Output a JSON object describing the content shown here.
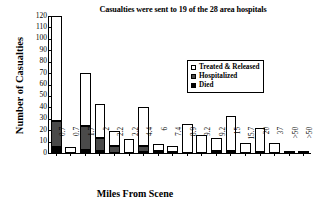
{
  "chart_data": {
    "type": "bar",
    "title": "Casualties were sent to 19 of the 28 area hospitals",
    "xlabel": "Miles From Scene",
    "ylabel": "Number of Casualties",
    "ylim": [
      0,
      120
    ],
    "yticks": [
      0,
      10,
      20,
      30,
      40,
      50,
      60,
      70,
      80,
      90,
      100,
      110,
      120
    ],
    "grid": false,
    "stacked": true,
    "legend_position": "upper-right",
    "categories": [
      "0.7",
      "0.7",
      "1.7",
      "2",
      "2.2",
      "2.2",
      "4.4",
      "6",
      "7.4",
      "8.9",
      "9.2",
      "9.2",
      "15",
      "15.7",
      "20",
      "37",
      ">50",
      ">50"
    ],
    "series": [
      {
        "name": "Treated & Released",
        "color": "#ffffff",
        "values": [
          92,
          5,
          46,
          30,
          13,
          12,
          34,
          6,
          5,
          25,
          16,
          11,
          30,
          9,
          21,
          9,
          1,
          1
        ]
      },
      {
        "name": "Hospitalized",
        "color": "#4a4a4a",
        "values": [
          23,
          0,
          21,
          11,
          6,
          0,
          5,
          2,
          1,
          0,
          0,
          2,
          2,
          0,
          1,
          0,
          0,
          0
        ]
      },
      {
        "name": "Died",
        "color": "#000000",
        "values": [
          5,
          0,
          3,
          2,
          0,
          0,
          1,
          0,
          0,
          0,
          0,
          0,
          0,
          0,
          0,
          0,
          0,
          0
        ]
      }
    ],
    "totals": [
      120,
      5,
      70,
      43,
      19,
      12,
      40,
      8,
      6,
      25,
      16,
      13,
      32,
      9,
      22,
      9,
      1,
      1
    ]
  },
  "legend": {
    "items": [
      {
        "label": "Treated & Released",
        "swatch": "open-square-icon"
      },
      {
        "label": "Hospitalized",
        "swatch": "gray-square-icon"
      },
      {
        "label": "Died",
        "swatch": "black-square-icon"
      }
    ]
  }
}
